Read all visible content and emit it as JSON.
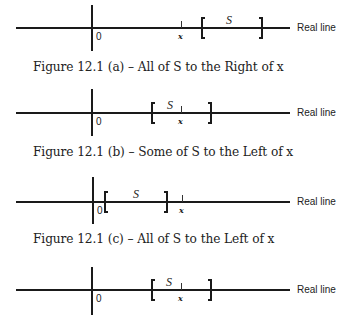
{
  "figures": [
    {
      "id": "a",
      "caption": "Figure 12.1 (a) – All of S to the Right of x",
      "zero_label": "0",
      "x_label": "x",
      "set_label": "S",
      "axis_label": "Real line"
    },
    {
      "id": "b",
      "caption": "Figure 12.1 (b) – Some of S to the Left of x",
      "zero_label": "0",
      "x_label": "x",
      "set_label": "S",
      "axis_label": "Real line"
    },
    {
      "id": "c",
      "caption": "Figure 12.1 (c) – All of S to the Left of x",
      "zero_label": "0",
      "x_label": "x",
      "set_label": "S",
      "axis_label": "Real line"
    },
    {
      "id": "d",
      "caption": "",
      "zero_label": "0",
      "x_label": "x",
      "set_label": "S",
      "axis_label": "Real line"
    }
  ]
}
